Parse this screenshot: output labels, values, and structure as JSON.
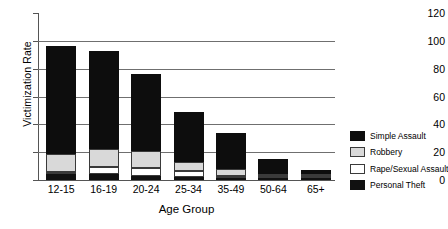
{
  "chart_data": {
    "type": "bar",
    "subtype": "stacked-bar",
    "title": "",
    "xlabel": "Age Group",
    "ylabel": "Victimization Rate",
    "categories": [
      "12-15",
      "16-19",
      "20-24",
      "25-34",
      "35-49",
      "50-64",
      "65+"
    ],
    "ylim": [
      0,
      120
    ],
    "yticks": [
      0,
      20,
      40,
      60,
      80,
      100,
      120
    ],
    "grid": "horizontal",
    "legend_position": "right",
    "series": [
      {
        "name": "Personal Theft",
        "color": "#111111",
        "values": [
          4.0,
          4.5,
          3.0,
          2.0,
          1.5,
          1.0,
          0.8
        ]
      },
      {
        "name": "Rape/Sexual Assault",
        "color": "#ffffff",
        "values": [
          2.0,
          5.0,
          5.5,
          4.5,
          1.5,
          0.8,
          0.4
        ]
      },
      {
        "name": "Robbery",
        "color": "#d9d9d9",
        "values": [
          12.5,
          12.5,
          12.5,
          6.5,
          5.0,
          1.2,
          0.6
        ]
      },
      {
        "name": "Simple Assault",
        "color": "#0d0d0d",
        "values": [
          77.5,
          71.0,
          55.0,
          36.0,
          26.0,
          11.0,
          3.2
        ]
      }
    ],
    "totals": [
      96,
      93,
      76,
      49,
      34,
      14,
      5
    ]
  },
  "legend": {
    "items": [
      {
        "label": "Simple Assault",
        "swatch": "simple"
      },
      {
        "label": "Robbery",
        "swatch": "robbery"
      },
      {
        "label": "Rape/Sexual Assault",
        "swatch": "rape"
      },
      {
        "label": "Personal Theft",
        "swatch": "theft"
      }
    ]
  }
}
